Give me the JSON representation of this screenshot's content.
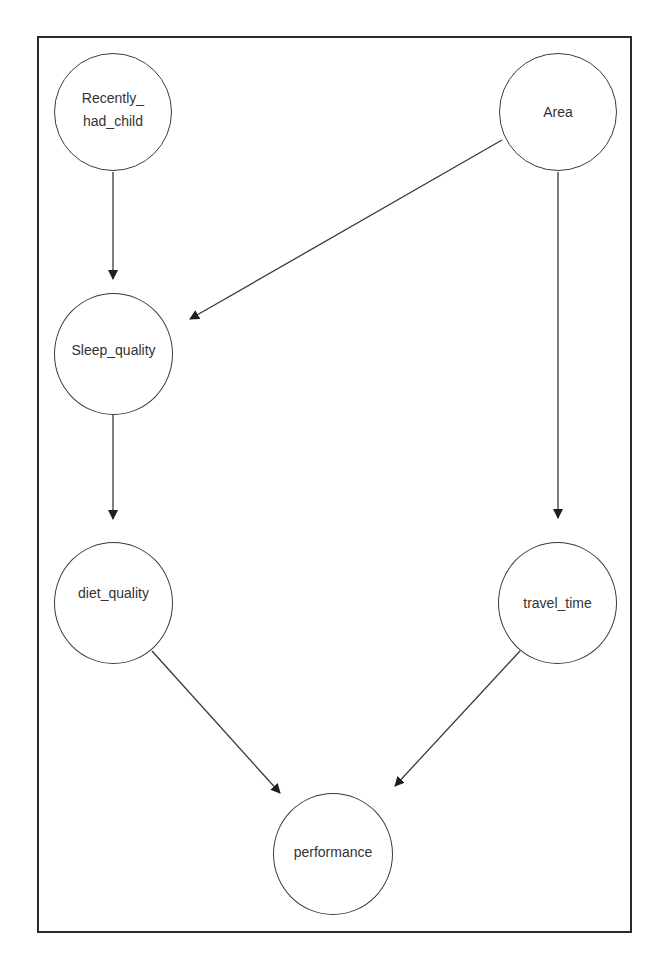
{
  "diagram": {
    "type": "directed-acyclic-graph",
    "colors": {
      "stroke": "#3a3a3a",
      "frame": "#2a2a2a",
      "text": "#333333",
      "background": "#ffffff"
    },
    "nodes": {
      "recently_had_child": {
        "label": "Recently_\nhad_child",
        "cx": 113,
        "cy": 112,
        "r": 59
      },
      "area": {
        "label": "Area",
        "cx": 558,
        "cy": 112,
        "r": 59
      },
      "sleep_quality": {
        "label": "Sleep_quality",
        "cx": 113,
        "cy": 353,
        "r": 60
      },
      "diet_quality": {
        "label": "diet_quality",
        "cx": 113,
        "cy": 603,
        "r": 60
      },
      "travel_time": {
        "label": "travel_time",
        "cx": 559,
        "cy": 603,
        "r": 60
      },
      "performance": {
        "label": "performance",
        "cx": 333,
        "cy": 853,
        "r": 60
      }
    },
    "edges": [
      {
        "from": "Recently_had_child",
        "to": "Sleep_quality"
      },
      {
        "from": "Area",
        "to": "Sleep_quality"
      },
      {
        "from": "Area",
        "to": "travel_time"
      },
      {
        "from": "Sleep_quality",
        "to": "diet_quality"
      },
      {
        "from": "diet_quality",
        "to": "performance"
      },
      {
        "from": "travel_time",
        "to": "performance"
      }
    ]
  }
}
